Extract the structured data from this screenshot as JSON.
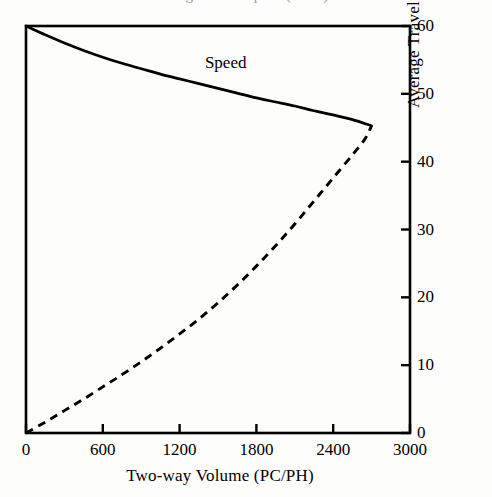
{
  "figure": {
    "cropped_header_text": "Average Travel Speed (MPH)",
    "series_label_speed": "Speed"
  },
  "chart_data": {
    "type": "line",
    "title": "",
    "xlabel": "Two-way Volume (PC/PH)",
    "ylabel": "Average Travel Speed (MPH)",
    "xlim": [
      0,
      3000
    ],
    "ylim": [
      0,
      60
    ],
    "xticks": [
      0,
      600,
      1200,
      1800,
      2400,
      3000
    ],
    "xtick_labels": [
      "0",
      "600",
      "1200",
      "1800",
      "2400",
      "3000"
    ],
    "yticks": [
      0,
      10,
      20,
      30,
      40,
      50,
      60
    ],
    "ytick_labels": [
      "0",
      "10",
      "20",
      "30",
      "40",
      "50",
      "60"
    ],
    "y_axis_side": "right",
    "grid": false,
    "legend": "inline-annotation",
    "annotations": [
      {
        "text": "Speed",
        "x": 1560,
        "y": 54.5
      }
    ],
    "series": [
      {
        "name": "Speed",
        "style": "solid",
        "color": "#000000",
        "x": [
          0,
          150,
          300,
          450,
          600,
          750,
          900,
          1050,
          1200,
          1350,
          1500,
          1650,
          1800,
          1950,
          2100,
          2250,
          2400,
          2550,
          2700
        ],
        "y": [
          60.0,
          58.7,
          57.5,
          56.4,
          55.4,
          54.5,
          53.7,
          52.9,
          52.2,
          51.5,
          50.8,
          50.1,
          49.4,
          48.8,
          48.2,
          47.5,
          46.9,
          46.2,
          45.3
        ]
      },
      {
        "name": "Volume-Speed (congested branch)",
        "style": "dashed",
        "color": "#000000",
        "x": [
          0,
          150,
          300,
          450,
          600,
          750,
          900,
          1050,
          1200,
          1350,
          1500,
          1650,
          1800,
          1950,
          2100,
          2250,
          2400,
          2550,
          2650,
          2700
        ],
        "y": [
          0.0,
          1.6,
          3.3,
          5.0,
          6.8,
          8.6,
          10.5,
          12.5,
          14.6,
          16.8,
          19.2,
          21.8,
          24.6,
          27.6,
          30.8,
          34.2,
          37.6,
          41.0,
          43.4,
          45.3
        ]
      }
    ]
  },
  "axes": {
    "x_tick_labels": [
      "0",
      "600",
      "1200",
      "1800",
      "2400",
      "3000"
    ],
    "y_tick_labels": [
      "0",
      "10",
      "20",
      "30",
      "40",
      "50",
      "60"
    ],
    "x_title": "Two-way Volume (PC/PH)",
    "y_title": "Average Travel Speed (MPH)"
  }
}
